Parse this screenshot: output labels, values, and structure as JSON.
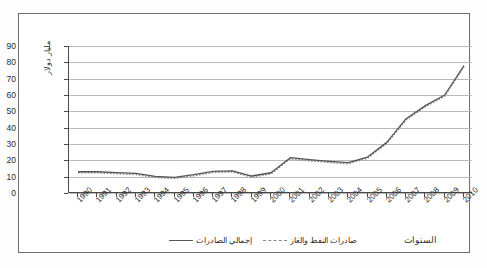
{
  "chart_data": {
    "type": "line",
    "title": "",
    "xlabel": "السنوات",
    "ylabel": "مليار دولار",
    "x": [
      "1990",
      "1991",
      "1992",
      "1993",
      "1994",
      "1995",
      "1996",
      "1997",
      "1998",
      "1999",
      "2000",
      "2001",
      "2002",
      "2003",
      "2004",
      "2005",
      "2006",
      "2007",
      "2008",
      "2009",
      "2010"
    ],
    "ylim": [
      0,
      90
    ],
    "yticks": [
      "0",
      "10",
      "20",
      "30",
      "40",
      "50",
      "60",
      "70",
      "80",
      "90"
    ],
    "grid": true,
    "legend_position": "bottom",
    "series": [
      {
        "name": "إجمالي الصادرات",
        "style": "solid",
        "color": "#555555",
        "values": [
          13.0,
          13.0,
          12.5,
          12.0,
          10.5,
          9.5,
          11.0,
          13.0,
          13.5,
          10.5,
          12.5,
          21.5,
          20.5,
          19.5,
          18.5,
          22.0,
          27.5,
          32.0,
          39.0,
          46.0,
          52.0
        ]
      },
      {
        "name": "صادرات النفط والغاز",
        "style": "dotted",
        "color": "#8a8a8a",
        "values": [
          12.5,
          12.5,
          12.0,
          11.5,
          10.0,
          9.2,
          10.5,
          12.5,
          13.0,
          10.0,
          12.0,
          21.0,
          20.0,
          19.0,
          18.0,
          21.5,
          27.0,
          31.5,
          38.5,
          45.5,
          51.5
        ]
      }
    ],
    "plotted_values": [
      13.0,
      13.0,
      12.5,
      12.0,
      10.5,
      9.5,
      11.0,
      13.0,
      13.5,
      10.5,
      12.5,
      21.5,
      20.5,
      19.5,
      18.5,
      22.0,
      27.5,
      32.0,
      39.0,
      46.0,
      52.0
    ]
  },
  "chart": {
    "points_total": [
      {
        "year": "1990",
        "value": 13.0
      },
      {
        "year": "1991",
        "value": 13.0
      },
      {
        "year": "1992",
        "value": 12.5
      },
      {
        "year": "1993",
        "value": 12.0
      },
      {
        "year": "1994",
        "value": 10.2
      },
      {
        "year": "1995",
        "value": 9.6
      },
      {
        "year": "1996",
        "value": 11.2
      },
      {
        "year": "1997",
        "value": 13.2
      },
      {
        "year": "1998",
        "value": 13.6
      },
      {
        "year": "1999",
        "value": 10.4
      },
      {
        "year": "2000",
        "value": 12.4
      },
      {
        "year": "2001",
        "value": 21.6
      },
      {
        "year": "2002",
        "value": 20.4
      },
      {
        "year": "2003",
        "value": 19.4
      },
      {
        "year": "2004",
        "value": 18.6
      },
      {
        "year": "2005",
        "value": 22.0
      },
      {
        "year": "2006",
        "value": 31.0
      },
      {
        "year": "2007",
        "value": 45.5
      },
      {
        "year": "2008",
        "value": 53.5
      },
      {
        "year": "2009",
        "value": 60.0
      },
      {
        "year": "2010",
        "value": 78.0
      }
    ]
  },
  "yaxis": {
    "ticks": [
      "90",
      "80",
      "70",
      "60",
      "50",
      "40",
      "30",
      "20",
      "10",
      "0"
    ],
    "title": "مليار دولار"
  },
  "xaxis": {
    "ticks": [
      "1990",
      "1991",
      "1992",
      "1993",
      "1994",
      "1995",
      "1996",
      "1997",
      "1998",
      "1999",
      "2000",
      "2001",
      "2002",
      "2003",
      "2004",
      "2005",
      "2006",
      "2007",
      "2008",
      "2009",
      "2010"
    ],
    "title": "السنوات"
  },
  "legend": {
    "items": [
      {
        "label": "إجمالي الصادرات",
        "style": "solid"
      },
      {
        "label": "صادرات النفط والغاز",
        "style": "dotted"
      }
    ]
  }
}
